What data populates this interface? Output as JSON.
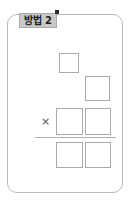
{
  "worksheet": {
    "method_tag": {
      "label": "방법 2",
      "background_color": "#c9c9c9",
      "border_color": "#a8a8a8",
      "text_color": "#1a1a1a"
    },
    "marker": {
      "name": "tag-corner-marker",
      "color": "#2b2b2b"
    },
    "card": {
      "border_color": "#b9b9b9",
      "background_color": "#ffffff"
    },
    "operator": {
      "symbol": "×",
      "name": "multiplication-sign",
      "color": "#555555"
    },
    "sum_line": {
      "color": "#b0b0b0"
    },
    "boxes": [
      {
        "name": "answer-box-top",
        "value": "",
        "row": "multiplicand-ones"
      },
      {
        "name": "answer-box-upper-right",
        "value": "",
        "row": "carry"
      },
      {
        "name": "answer-box-mid-left",
        "value": "",
        "row": "multiplicand-tens"
      },
      {
        "name": "answer-box-mid-right",
        "value": "",
        "row": "multiplicand-ones"
      },
      {
        "name": "answer-box-bottom-left",
        "value": "",
        "row": "product-tens"
      },
      {
        "name": "answer-box-bottom-right",
        "value": "",
        "row": "product-ones"
      }
    ]
  }
}
